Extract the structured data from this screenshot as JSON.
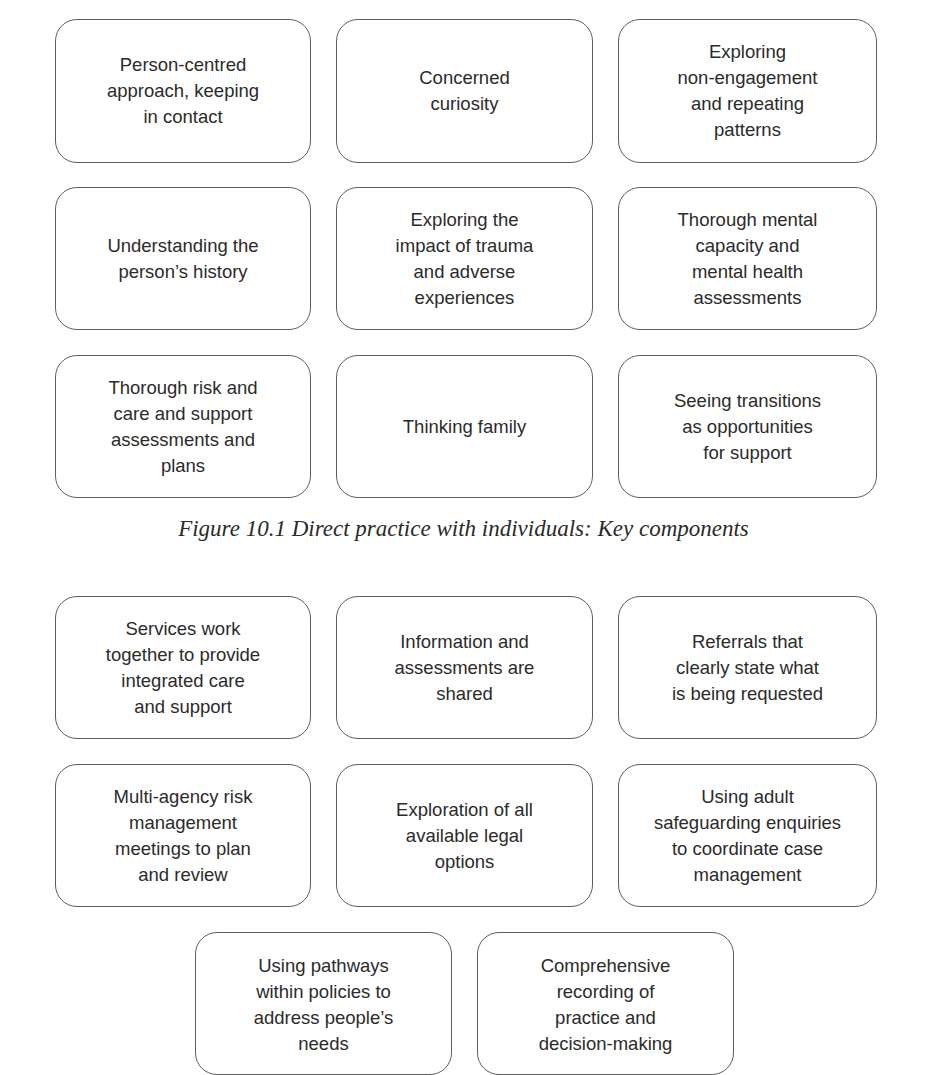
{
  "figure_1": {
    "caption": "Figure 10.1 Direct practice with individuals: Key components",
    "boxes": [
      "Person-centred\napproach, keeping\nin contact",
      "Concerned\ncuriosity",
      "Exploring\nnon-engagement\nand repeating\npatterns",
      "Understanding the\nperson’s history",
      "Exploring the\nimpact of trauma\nand adverse\nexperiences",
      "Thorough mental\ncapacity and\nmental health\nassessments",
      "Thorough risk and\ncare and support\nassessments and\nplans",
      "Thinking family",
      "Seeing transitions\nas opportunities\nfor support"
    ]
  },
  "figure_2": {
    "boxes": [
      "Services work\ntogether to provide\nintegrated care\nand support",
      "Information and\nassessments are\nshared",
      "Referrals that\nclearly state what\nis being requested",
      "Multi-agency risk\nmanagement\nmeetings to plan\nand review",
      "Exploration of all\navailable legal\noptions",
      "Using adult\nsafeguarding enquiries\nto coordinate case\nmanagement",
      "Using pathways\nwithin policies to\naddress people’s\nneeds",
      "Comprehensive\nrecording of\npractice and\ndecision-making"
    ]
  },
  "colors": {
    "border": "#5e5e5e",
    "text": "#2b2b2b",
    "background": "#ffffff"
  }
}
